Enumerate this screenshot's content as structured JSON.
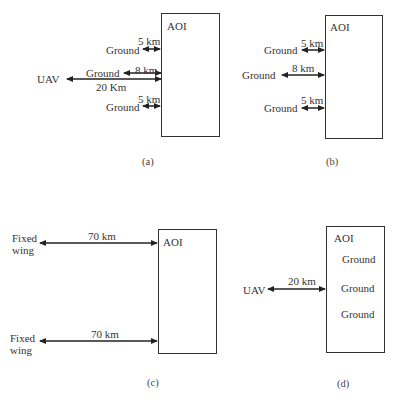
{
  "panels": {
    "a": {
      "caption": "(a)",
      "aoi_label": "AOI",
      "links": [
        {
          "node": "Ground",
          "distance": "5 km"
        },
        {
          "node": "Ground",
          "distance": "8 km"
        },
        {
          "node": "UAV",
          "distance": "20 Km"
        },
        {
          "node": "Ground",
          "distance": "5 km"
        }
      ]
    },
    "b": {
      "caption": "(b)",
      "aoi_label": "AOI",
      "links": [
        {
          "node": "Ground",
          "distance": "5 km"
        },
        {
          "node": "Ground",
          "distance": "8 km"
        },
        {
          "node": "Ground",
          "distance": "5 km"
        }
      ]
    },
    "c": {
      "caption": "(c)",
      "aoi_label": "AOI",
      "links": [
        {
          "node_line1": "Fixed",
          "node_line2": "wing",
          "distance": "70 km"
        },
        {
          "node_line1": "Fixed",
          "node_line2": "wing",
          "distance": "70 km"
        }
      ]
    },
    "d": {
      "caption": "(d)",
      "aoi_label": "AOI",
      "inside": [
        "Ground",
        "Ground",
        "Ground"
      ],
      "links": [
        {
          "node": "UAV",
          "distance": "20 km"
        }
      ]
    }
  },
  "colors": {
    "line": "#333333",
    "background": "#ffffff"
  }
}
